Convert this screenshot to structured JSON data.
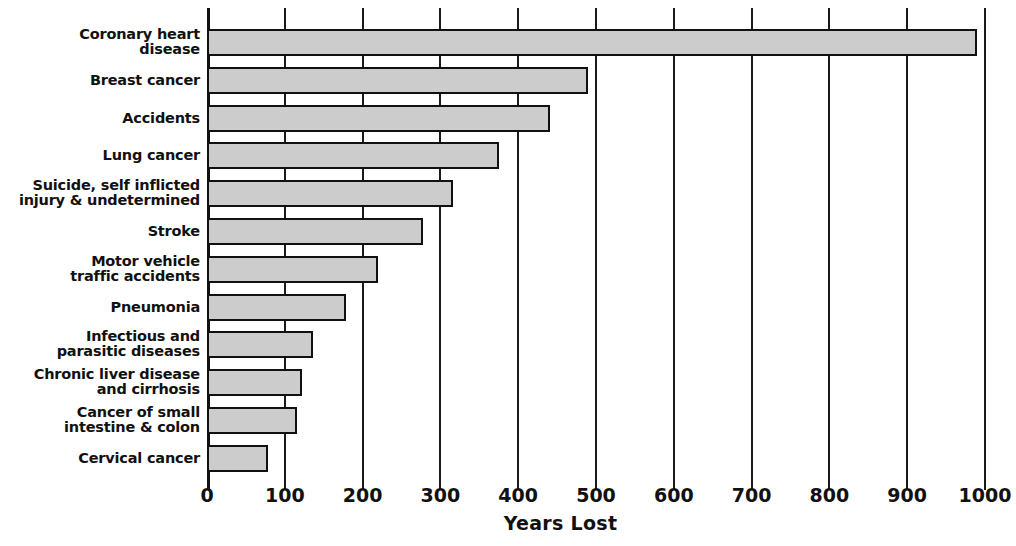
{
  "chart_data": {
    "type": "bar",
    "orientation": "horizontal",
    "title": "",
    "xlabel": "Years Lost",
    "ylabel": "",
    "xlim": [
      0,
      1000
    ],
    "xticks": [
      0,
      100,
      200,
      300,
      400,
      500,
      600,
      700,
      800,
      900,
      1000
    ],
    "xtick_labels": [
      "0",
      "100",
      "200",
      "300",
      "400",
      "500",
      "600",
      "700",
      "800",
      "900",
      "1000"
    ],
    "grid": true,
    "grid_axis": "x",
    "legend": false,
    "bar_fill_color": "#cccccc",
    "bar_edge_color": "#111111",
    "categories": [
      "Coronary heart disease",
      "Breast cancer",
      "Accidents",
      "Lung cancer",
      "Suicide, self inflicted injury & undetermined",
      "Stroke",
      "Motor vehicle traffic accidents",
      "Pneumonia",
      "Infectious and parasitic diseases",
      "Chronic liver disease and cirrhosis",
      "Cancer of small intestine & colon",
      "Cervical cancer"
    ],
    "category_lines": [
      [
        "Coronary heart",
        "disease"
      ],
      [
        "Breast cancer",
        ""
      ],
      [
        "Accidents",
        ""
      ],
      [
        "Lung cancer",
        ""
      ],
      [
        "Suicide, self inflicted",
        "injury & undetermined"
      ],
      [
        "Stroke",
        ""
      ],
      [
        "Motor vehicle",
        "traffic accidents"
      ],
      [
        "Pneumonia",
        ""
      ],
      [
        "Infectious and",
        "parasitic diseases"
      ],
      [
        "Chronic liver disease",
        "and cirrhosis"
      ],
      [
        "Cancer of small",
        "intestine & colon"
      ],
      [
        "Cervical cancer",
        ""
      ]
    ],
    "values": [
      990,
      490,
      441,
      375,
      316,
      278,
      220,
      179,
      136,
      122,
      116,
      79
    ]
  }
}
